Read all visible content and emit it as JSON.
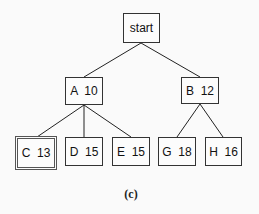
{
  "diagram": {
    "type": "search-tree",
    "root": {
      "id": "start",
      "label": "start"
    },
    "nodes": [
      {
        "id": "A",
        "label": "A  10",
        "parent": "start"
      },
      {
        "id": "B",
        "label": "B  12",
        "parent": "start"
      },
      {
        "id": "C",
        "label": "C  13",
        "parent": "A",
        "goal": true
      },
      {
        "id": "D",
        "label": "D  15",
        "parent": "A"
      },
      {
        "id": "E",
        "label": "E  15",
        "parent": "A"
      },
      {
        "id": "G",
        "label": "G  18",
        "parent": "B"
      },
      {
        "id": "H",
        "label": "H  16",
        "parent": "B"
      }
    ],
    "caption": "(c)"
  }
}
